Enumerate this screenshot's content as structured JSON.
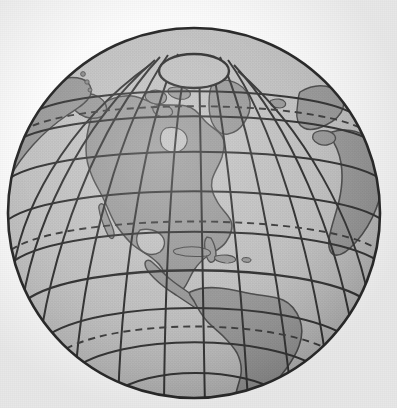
{
  "figure": {
    "projection": "orthographic",
    "style": "grayscale line illustration with graticule",
    "background_color": "#fdfdfd",
    "ocean_color": "#c3c3c3",
    "land_color": "#9a9a9a",
    "outline_color": "#2b2b2b",
    "graticule_color": "#2f2f2f",
    "dashed_line_color": "#3a3a3a",
    "shadow_color": "#8d8d8d"
  },
  "globe": {
    "center_x": 194,
    "center_y": 213,
    "radius_x": 186,
    "radius_y": 185,
    "view_center_longitude": -80,
    "view_center_latitude": 28,
    "outline_width": 2.6
  },
  "graticule": {
    "label": "latitude and longitude grid",
    "meridian_interval_degrees": 20,
    "parallel_interval_degrees": 15,
    "line_width": 2.0,
    "meridian_longitudes": [
      -180,
      -160,
      -140,
      -120,
      -100,
      -80,
      -60,
      -40,
      -20,
      0,
      20,
      40
    ],
    "parallel_latitudes": [
      -45,
      -30,
      -15,
      0,
      15,
      30,
      45,
      60,
      75
    ]
  },
  "special_lines": [
    {
      "name": "equator",
      "latitude": 0,
      "style": "solid",
      "label": "Equator"
    },
    {
      "name": "tropic-of-cancer",
      "latitude": 23.5,
      "style": "dashed",
      "label": "Tropic of Cancer"
    },
    {
      "name": "tropic-of-capricorn",
      "latitude": -23.5,
      "style": "dashed",
      "label": "Tropic of Capricorn"
    },
    {
      "name": "arctic-circle",
      "latitude": 66.5,
      "style": "dashed",
      "label": "Arctic Circle"
    }
  ],
  "polar_cap": {
    "name": "north-polar-cap",
    "label": "North Pole cap ellipse",
    "center_x": 194,
    "center_y": 71,
    "radius_x": 35,
    "radius_y": 17,
    "fill": "#c3c3c3"
  },
  "landmasses": [
    {
      "name": "north-america",
      "label": "North America"
    },
    {
      "name": "south-america",
      "label": "South America"
    },
    {
      "name": "greenland",
      "label": "Greenland"
    },
    {
      "name": "canadian-arctic-islands",
      "label": "Canadian Arctic Archipelago"
    },
    {
      "name": "alaska",
      "label": "Alaska"
    },
    {
      "name": "siberia",
      "label": "Siberia"
    },
    {
      "name": "europe",
      "label": "Europe"
    },
    {
      "name": "africa",
      "label": "Africa"
    },
    {
      "name": "caribbean-islands",
      "label": "Caribbean Islands"
    },
    {
      "name": "aleutian-islands",
      "label": "Aleutian Islands"
    },
    {
      "name": "iceland",
      "label": "Iceland"
    }
  ]
}
